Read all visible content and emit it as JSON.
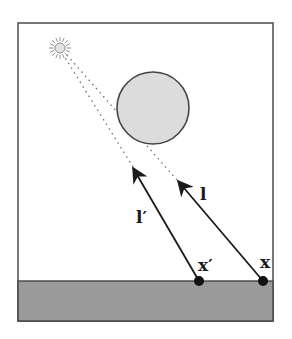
{
  "diagram": {
    "labels": {
      "point_x": "x",
      "point_x_prime": "x′",
      "ray_l": "l",
      "ray_l_prime": "l′"
    },
    "elements": {
      "light_source": "sun-icon",
      "occluder": "sphere",
      "ground": "ground-plane"
    },
    "colors": {
      "frame": "#555555",
      "ground_fill": "#9a9a9a",
      "occluder_fill": "#dcdcdc",
      "occluder_stroke": "#444444",
      "ray": "#1a1a1a",
      "dotted_ray": "#777777",
      "point": "#111111"
    }
  }
}
